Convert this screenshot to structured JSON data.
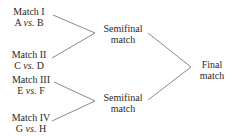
{
  "diagram": {
    "type": "tournament-bracket",
    "matches": [
      {
        "title": "Match I",
        "team_a": "A",
        "vs": "vs.",
        "team_b": "B"
      },
      {
        "title": "Match II",
        "team_a": "C",
        "vs": "vs.",
        "team_b": "D"
      },
      {
        "title": "Match III",
        "team_a": "E",
        "vs": "vs.",
        "team_b": "F"
      },
      {
        "title": "Match IV",
        "team_a": "G",
        "vs": "vs.",
        "team_b": "H"
      }
    ],
    "semifinals": [
      {
        "line1": "Semifinal",
        "line2": "match"
      },
      {
        "line1": "Semifinal",
        "line2": "match"
      }
    ],
    "final": {
      "line1": "Final",
      "line2": "match"
    },
    "line_color": "#8a8a8a",
    "text_color": "#2a2a2a"
  }
}
